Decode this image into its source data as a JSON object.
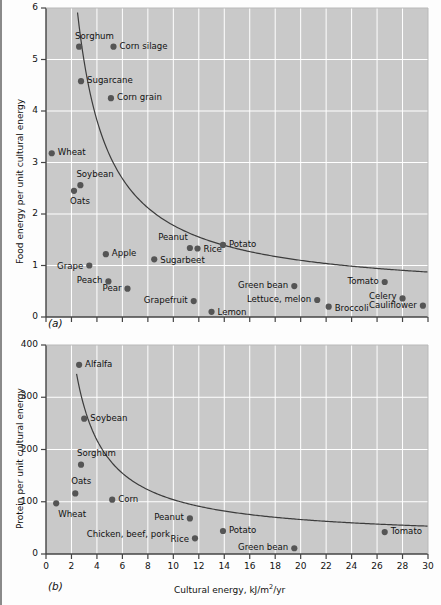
{
  "figure": {
    "panel_a_id": "(a)",
    "panel_b_id": "(b)",
    "marker_color": "#555555",
    "plot_bg_color": "#c9c9c9",
    "grid_color": "#ffffff",
    "curve_color": "#3c3c3c"
  },
  "chart_data": [
    {
      "type": "scatter",
      "panel": "(a)",
      "title": "",
      "xlabel": "",
      "ylabel": "Food energy per unit cultural energy",
      "xlim": [
        0,
        30
      ],
      "ylim": [
        0,
        6
      ],
      "xticks": [
        0,
        2,
        4,
        6,
        8,
        10,
        12,
        14,
        16,
        18,
        20,
        22,
        24,
        26,
        28,
        30
      ],
      "xtick_labels": [
        "",
        "",
        "",
        "",
        "",
        "",
        "",
        "",
        "",
        "",
        "",
        "",
        "",
        "",
        "",
        ""
      ],
      "yticks": [
        0,
        1,
        2,
        3,
        4,
        5,
        6
      ],
      "ytick_labels": [
        "0",
        "1",
        "2",
        "3",
        "4",
        "5",
        "6"
      ],
      "grid": true,
      "legend": "none",
      "points": [
        {
          "label": "Sorghum",
          "x": 2.6,
          "y": 5.25,
          "lx": -4,
          "ly": -10,
          "anchor": "start"
        },
        {
          "label": "Corn silage",
          "x": 5.3,
          "y": 5.25,
          "lx": 6,
          "ly": 0,
          "anchor": "start"
        },
        {
          "label": "Sugarcane",
          "x": 2.75,
          "y": 4.58,
          "lx": 6,
          "ly": 0,
          "anchor": "start"
        },
        {
          "label": "Corn grain",
          "x": 5.1,
          "y": 4.25,
          "lx": 6,
          "ly": 0,
          "anchor": "start"
        },
        {
          "label": "Wheat",
          "x": 0.45,
          "y": 3.18,
          "lx": 6,
          "ly": 0,
          "anchor": "start"
        },
        {
          "label": "Soybean",
          "x": 2.7,
          "y": 2.56,
          "lx": -4,
          "ly": -10,
          "anchor": "start"
        },
        {
          "label": "Oats",
          "x": 2.2,
          "y": 2.45,
          "lx": -4,
          "ly": 11,
          "anchor": "start"
        },
        {
          "label": "Peanut",
          "x": 11.3,
          "y": 1.34,
          "lx": -2,
          "ly": -10,
          "anchor": "end"
        },
        {
          "label": "Rice",
          "x": 11.9,
          "y": 1.33,
          "lx": 6,
          "ly": 1,
          "anchor": "start"
        },
        {
          "label": "Potato",
          "x": 13.9,
          "y": 1.4,
          "lx": 6,
          "ly": 0,
          "anchor": "start"
        },
        {
          "label": "Apple",
          "x": 4.7,
          "y": 1.22,
          "lx": 6,
          "ly": 0,
          "anchor": "start"
        },
        {
          "label": "Sugarbeet",
          "x": 8.5,
          "y": 1.12,
          "lx": 6,
          "ly": 2,
          "anchor": "start"
        },
        {
          "label": "Grape",
          "x": 3.4,
          "y": 1.0,
          "lx": -6,
          "ly": 1,
          "anchor": "end"
        },
        {
          "label": "Peach",
          "x": 4.9,
          "y": 0.69,
          "lx": -6,
          "ly": 0,
          "anchor": "end"
        },
        {
          "label": "Tomato",
          "x": 26.6,
          "y": 0.68,
          "lx": -6,
          "ly": 0,
          "anchor": "end"
        },
        {
          "label": "Green bean",
          "x": 19.5,
          "y": 0.6,
          "lx": -6,
          "ly": 0,
          "anchor": "end"
        },
        {
          "label": "Pear",
          "x": 6.4,
          "y": 0.55,
          "lx": -6,
          "ly": 0,
          "anchor": "end"
        },
        {
          "label": "Celery",
          "x": 28.0,
          "y": 0.36,
          "lx": -6,
          "ly": -1,
          "anchor": "end"
        },
        {
          "label": "Lettuce, melon",
          "x": 21.3,
          "y": 0.33,
          "lx": -6,
          "ly": 0,
          "anchor": "end"
        },
        {
          "label": "Grapefruit",
          "x": 11.6,
          "y": 0.31,
          "lx": -6,
          "ly": 0,
          "anchor": "end"
        },
        {
          "label": "Cauliflower",
          "x": 29.6,
          "y": 0.22,
          "lx": -6,
          "ly": 0,
          "anchor": "end"
        },
        {
          "label": "Broccoli",
          "x": 22.2,
          "y": 0.2,
          "lx": 6,
          "ly": 2,
          "anchor": "start"
        },
        {
          "label": "Lemon",
          "x": 13.0,
          "y": 0.1,
          "lx": 6,
          "ly": 1,
          "anchor": "start"
        }
      ],
      "curve": {
        "form": "hyperbolic",
        "a": 13.6,
        "c": 0.42,
        "x_start": 2.35,
        "x_end": 30
      }
    },
    {
      "type": "scatter",
      "panel": "(b)",
      "title": "",
      "xlabel": "Cultural energy, kJ/m2/yr",
      "ylabel": "Protein per unit cultural energy",
      "xlim": [
        0,
        30
      ],
      "ylim": [
        0,
        400
      ],
      "xticks": [
        0,
        2,
        4,
        6,
        8,
        10,
        12,
        14,
        16,
        18,
        20,
        22,
        24,
        26,
        28,
        30
      ],
      "xtick_labels": [
        "0",
        "2",
        "4",
        "6",
        "8",
        "10",
        "12",
        "14",
        "16",
        "18",
        "20",
        "22",
        "24",
        "26",
        "28",
        "30"
      ],
      "yticks": [
        0,
        100,
        200,
        300,
        400
      ],
      "ytick_labels": [
        "0",
        "100",
        "200",
        "300",
        "400"
      ],
      "grid": true,
      "legend": "none",
      "points": [
        {
          "label": "Alfalfa",
          "x": 2.6,
          "y": 362,
          "lx": 6,
          "ly": 0,
          "anchor": "start"
        },
        {
          "label": "Soybean",
          "x": 3.0,
          "y": 259,
          "lx": 6,
          "ly": 0,
          "anchor": "start"
        },
        {
          "label": "Sorghum",
          "x": 2.75,
          "y": 171,
          "lx": -4,
          "ly": -11,
          "anchor": "start"
        },
        {
          "label": "Oats",
          "x": 2.3,
          "y": 116,
          "lx": -4,
          "ly": -11,
          "anchor": "start"
        },
        {
          "label": "Corn",
          "x": 5.2,
          "y": 104,
          "lx": 6,
          "ly": 0,
          "anchor": "start"
        },
        {
          "label": "Wheat",
          "x": 0.8,
          "y": 97,
          "lx": 2,
          "ly": 12,
          "anchor": "start"
        },
        {
          "label": "Peanut",
          "x": 11.3,
          "y": 68,
          "lx": -6,
          "ly": 0,
          "anchor": "end"
        },
        {
          "label": "Potato",
          "x": 13.9,
          "y": 44,
          "lx": 6,
          "ly": 0,
          "anchor": "start"
        },
        {
          "label": "Tomato",
          "x": 26.6,
          "y": 42,
          "lx": 6,
          "ly": 0,
          "anchor": "start"
        },
        {
          "label": "Rice",
          "x": 11.7,
          "y": 30,
          "lx": -6,
          "ly": 2,
          "anchor": "end"
        },
        {
          "label": "Green bean",
          "x": 19.5,
          "y": 11,
          "lx": -6,
          "ly": 0,
          "anchor": "end"
        }
      ],
      "text_only_labels": [
        {
          "label": "Chicken, beef, pork",
          "x": 3.2,
          "y": 37
        }
      ],
      "curve": {
        "form": "hyperbolic",
        "a": 760,
        "c": 28,
        "x_start": 2.4,
        "x_end": 30
      }
    }
  ]
}
